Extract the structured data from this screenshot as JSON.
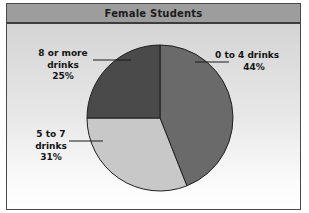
{
  "chart": {
    "title": "Female Students"
  },
  "chart_data": {
    "type": "pie",
    "title": "Female Students",
    "xlabel": "",
    "ylabel": "",
    "legend_position": "none",
    "grid": false,
    "categories": [
      "0 to 4 drinks",
      "5 to 7 drinks",
      "8 or more drinks"
    ],
    "values": [
      44,
      31,
      25
    ],
    "value_unit": "%",
    "start_angle_deg": 0,
    "direction": "clockwise",
    "slices": [
      {
        "label": "0 to 4 drinks",
        "label_line1": "0 to 4 drinks",
        "label_line2": "44%",
        "value": 44,
        "value_text": "44%",
        "color": "#6a6a6a",
        "start_deg": 0,
        "end_deg": 158.4
      },
      {
        "label": "5 to 7 drinks",
        "label_line1": "5 to 7",
        "label_line2": "drinks",
        "label_line3": "31%",
        "value": 31,
        "value_text": "31%",
        "color": "#c8c8c8",
        "start_deg": 158.4,
        "end_deg": 270.0
      },
      {
        "label": "8 or more drinks",
        "label_line1": "8 or more",
        "label_line2": "drinks",
        "label_line3": "25%",
        "value": 25,
        "value_text": "25%",
        "color": "#4a4a4a",
        "start_deg": 270.0,
        "end_deg": 360.0
      }
    ],
    "colors": {
      "slice_low": "#6a6a6a",
      "slice_mid": "#c8c8c8",
      "slice_high": "#4a4a4a",
      "title_band": "#9d9d9d",
      "outline": "#1f1f1f",
      "frame_border": "#4a4a4a"
    }
  }
}
